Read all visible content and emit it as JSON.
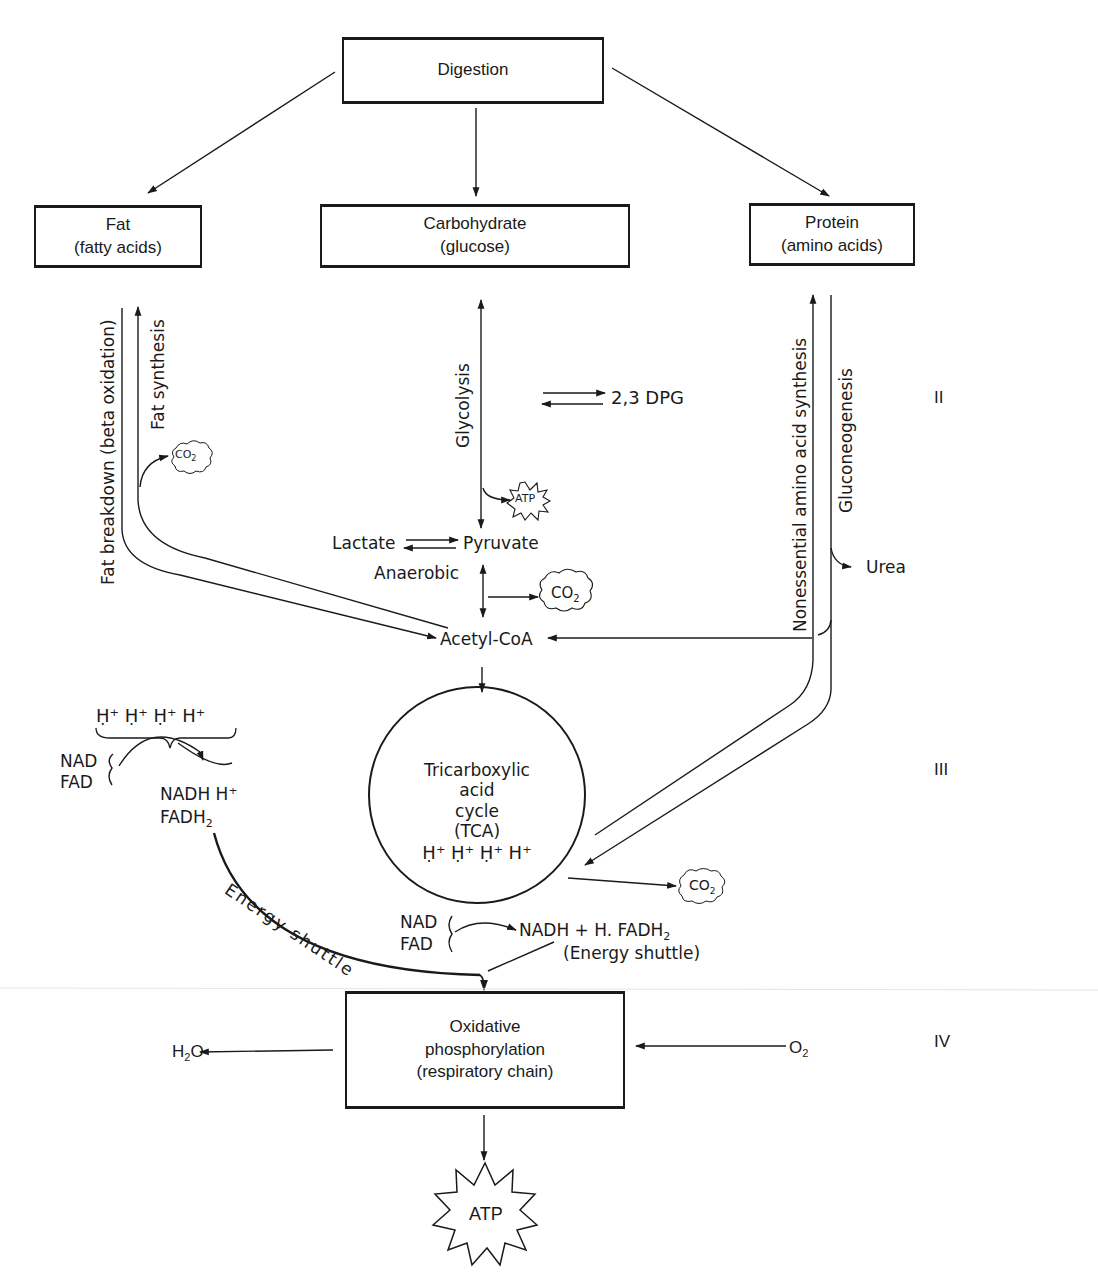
{
  "boxes": {
    "digestion": "Digestion",
    "fat": {
      "line1": "Fat",
      "line2": "(fatty acids)"
    },
    "carbohydrate": {
      "line1": "Carbohydrate",
      "line2": "(glucose)"
    },
    "protein": {
      "line1": "Protein",
      "line2": "(amino acids)"
    },
    "oxidative": {
      "line1": "Oxidative",
      "line2": "phosphorylation",
      "line3": "(respiratory chain)"
    }
  },
  "pathways": {
    "fat_breakdown": "Fat breakdown (beta oxidation)",
    "fat_synthesis": "Fat synthesis",
    "glycolysis": "Glycolysis",
    "nonessential": "Nonessential amino acid synthesis",
    "gluconeogenesis": "Gluconeogenesis",
    "energy_shuttle_curve": "Energy shuttle"
  },
  "metabolites": {
    "dpg": "2,3 DPG",
    "lactate": "Lactate",
    "pyruvate": "Pyruvate",
    "anaerobic": "Anaerobic",
    "acetyl_coa": "Acetyl-CoA",
    "urea": "Urea",
    "co2": "CO",
    "co2_sub": "2",
    "atp": "ATP",
    "h2o_h": "H",
    "h2o_sub": "2",
    "h2o_o": "O",
    "o2": "O",
    "o2_sub": "2"
  },
  "tca": {
    "line1": "Tricarboxylic",
    "line2": "acid",
    "line3": "cycle",
    "line4": "(TCA)",
    "protons": "Ḥ⁺ Ḥ⁺ Ḥ⁺ H⁺"
  },
  "left_cluster": {
    "protons": "Ḥ⁺ Ḥ⁺ Ḥ⁺ H⁺",
    "nad": "NAD",
    "fad": "FAD",
    "nadh": "NADH  H⁺",
    "fadh": "FADH",
    "fadh_sub": "2"
  },
  "tca_outputs": {
    "nad": "NAD",
    "fad": "FAD",
    "products": "NADH + H. FADH",
    "products_sub": "2",
    "shuttle": "(Energy shuttle)"
  },
  "stages": {
    "II": "II",
    "III": "III",
    "IV": "IV"
  }
}
